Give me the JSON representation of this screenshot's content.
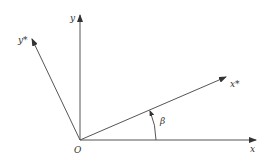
{
  "diagram": {
    "type": "coordinate-rotation",
    "labels": {
      "origin": "O",
      "x_axis": "x",
      "y_axis": "y",
      "x_star_axis": "x*",
      "y_star_axis": "y*",
      "angle": "β"
    },
    "colors": {
      "line": "#555555",
      "text": "#333333",
      "background": "#ffffff"
    },
    "geometry": {
      "origin": [
        80,
        140
      ],
      "x_axis_end": [
        257,
        140
      ],
      "y_axis_end": [
        80,
        14
      ],
      "x_star_end": [
        227,
        76
      ],
      "y_star_end": [
        31,
        38
      ],
      "angle_arc_radius": 76
    }
  }
}
